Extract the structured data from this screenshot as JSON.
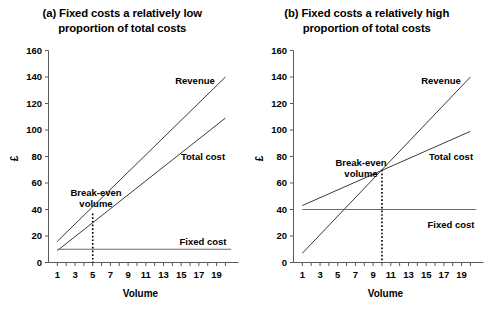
{
  "figure": {
    "width": 489,
    "height": 313,
    "background": "#ffffff",
    "line_color": "#3a3a3a",
    "axis_color": "#5a5a5a"
  },
  "chart_data": [
    {
      "type": "line",
      "panel_id": "a",
      "title": "(a) Fixed costs a relatively low proportion of total costs",
      "title_line1": "(a) Fixed costs a relatively low",
      "title_line2": "proportion of total costs",
      "xlabel": "Volume",
      "ylabel": "£",
      "xlim": [
        0,
        20.8
      ],
      "ylim": [
        0,
        160
      ],
      "yticks": [
        0,
        20,
        40,
        60,
        80,
        100,
        120,
        140,
        160
      ],
      "xticks": [
        1,
        3,
        5,
        7,
        9,
        11,
        13,
        15,
        17,
        19
      ],
      "x_minor_ticks": [
        2,
        4,
        6,
        8,
        10,
        12,
        14,
        16,
        18,
        20
      ],
      "grid": false,
      "legend": "inline-labels",
      "x": [
        1,
        20
      ],
      "series": [
        {
          "name": "Revenue",
          "label": "Revenue",
          "values": [
            16,
            140
          ],
          "intercept": 9.5,
          "slope": 6.55
        },
        {
          "name": "Total cost",
          "label": "Total cost",
          "values": [
            9,
            109
          ],
          "intercept": 3.7,
          "slope": 5.26
        },
        {
          "name": "Fixed cost",
          "label": "Fixed cost",
          "values": [
            10,
            10
          ],
          "intercept": 10,
          "slope": 0
        }
      ],
      "annotations": [
        {
          "name": "break-even-volume",
          "text_line1": "Break-even",
          "text_line2": "volume",
          "x": 5,
          "y": 37
        }
      ]
    },
    {
      "type": "line",
      "panel_id": "b",
      "title": "(b) Fixed costs a relatively high proportion of total costs",
      "title_line1": "(b) Fixed costs a relatively high",
      "title_line2": "proportion of total costs",
      "xlabel": "Volume",
      "ylabel": "£",
      "xlim": [
        0,
        20.8
      ],
      "ylim": [
        0,
        160
      ],
      "yticks": [
        0,
        20,
        40,
        60,
        80,
        100,
        120,
        140,
        160
      ],
      "xticks": [
        1,
        3,
        5,
        7,
        9,
        11,
        13,
        15,
        17,
        19
      ],
      "x_minor_ticks": [
        2,
        4,
        6,
        8,
        10,
        12,
        14,
        16,
        18,
        20
      ],
      "grid": false,
      "legend": "inline-labels",
      "x": [
        1,
        20
      ],
      "series": [
        {
          "name": "Revenue",
          "label": "Revenue",
          "values": [
            7,
            140
          ],
          "intercept": 0,
          "slope": 7.0
        },
        {
          "name": "Total cost",
          "label": "Total cost",
          "values": [
            43,
            99
          ],
          "intercept": 40,
          "slope": 2.95
        },
        {
          "name": "Fixed cost",
          "label": "Fixed cost",
          "values": [
            40,
            40
          ],
          "intercept": 40,
          "slope": 0
        }
      ],
      "annotations": [
        {
          "name": "break-even-volume",
          "text_line1": "Break-even",
          "text_line2": "volume",
          "x": 10,
          "y": 70
        }
      ]
    }
  ]
}
